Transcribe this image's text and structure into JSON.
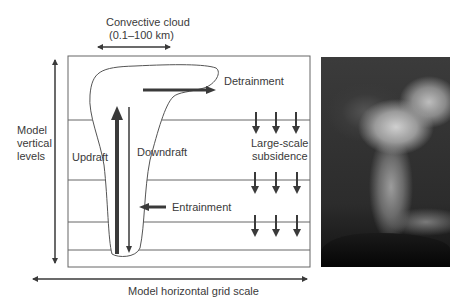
{
  "figure": {
    "labels": {
      "convective_cloud_line1": "Convective cloud",
      "convective_cloud_line2": "(0.1–100 km)",
      "detrainment": "Detrainment",
      "large_scale_line1": "Large-scale",
      "large_scale_line2": "subsidence",
      "updraft": "Updraft",
      "downdraft": "Downdraft",
      "entrainment": "Entrainment",
      "model_vertical_line1": "Model",
      "model_vertical_line2": "vertical",
      "model_vertical_line3": "levels",
      "horizontal_scale": "Model horizontal grid scale"
    },
    "colors": {
      "arrow": "#3a3a3a",
      "line": "#555555",
      "photo_dark": "#1a1a1a"
    },
    "photo": {
      "description": "cumulonimbus-cloud-photo"
    }
  }
}
